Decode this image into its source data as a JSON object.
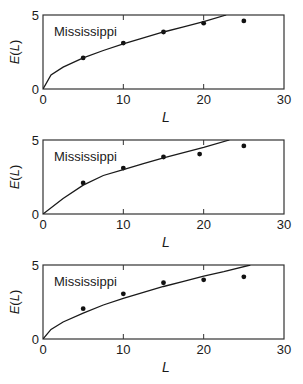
{
  "chart_data": [
    {
      "type": "scatter",
      "title": "",
      "annotation": "Mississippi",
      "xlabel": "L",
      "ylabel": "E(L)",
      "xlim": [
        0,
        30
      ],
      "ylim": [
        0,
        5
      ],
      "xticks": [
        0,
        10,
        20,
        30
      ],
      "yticks": [
        0,
        5
      ],
      "grid": false,
      "legend": "none",
      "series": [
        {
          "name": "observed",
          "kind": "points",
          "x": [
            5,
            10,
            15,
            20,
            25
          ],
          "y": [
            2.1,
            3.1,
            3.85,
            4.45,
            4.6
          ]
        },
        {
          "name": "model",
          "kind": "line",
          "x": [
            0,
            1,
            2.5,
            5,
            7.5,
            10,
            12.5,
            15,
            17.5,
            20,
            22.8
          ],
          "y": [
            0,
            0.95,
            1.48,
            2.1,
            2.6,
            3.05,
            3.45,
            3.85,
            4.2,
            4.55,
            5.0
          ]
        }
      ],
      "frame": {
        "top": 15,
        "bottom": 89
      }
    },
    {
      "type": "scatter",
      "title": "",
      "annotation": "Mississippi",
      "xlabel": "L",
      "ylabel": "E(L)",
      "xlim": [
        0,
        30
      ],
      "ylim": [
        0,
        5
      ],
      "xticks": [
        0,
        10,
        20,
        30
      ],
      "yticks": [
        0,
        5
      ],
      "grid": false,
      "legend": "none",
      "series": [
        {
          "name": "observed",
          "kind": "points",
          "x": [
            5,
            10,
            15,
            19.5,
            25
          ],
          "y": [
            2.1,
            3.1,
            3.85,
            4.05,
            4.6
          ]
        },
        {
          "name": "model",
          "kind": "line",
          "x": [
            0,
            2.5,
            5,
            7.5,
            10,
            12.5,
            15,
            17.5,
            20,
            23.2
          ],
          "y": [
            0,
            1.05,
            1.95,
            2.6,
            3.0,
            3.4,
            3.8,
            4.15,
            4.5,
            5.0
          ]
        }
      ],
      "frame": {
        "top": 140,
        "bottom": 214
      }
    },
    {
      "type": "scatter",
      "title": "",
      "annotation": "Mississippi",
      "xlabel": "L",
      "ylabel": "E(L)",
      "xlim": [
        0,
        30
      ],
      "ylim": [
        0,
        5
      ],
      "xticks": [
        0,
        10,
        20,
        30
      ],
      "yticks": [
        0,
        5
      ],
      "grid": false,
      "legend": "none",
      "series": [
        {
          "name": "observed",
          "kind": "points",
          "x": [
            5,
            10,
            15,
            20,
            25
          ],
          "y": [
            2.05,
            3.05,
            3.8,
            4.0,
            4.2
          ]
        },
        {
          "name": "model",
          "kind": "line",
          "x": [
            0,
            1,
            2.5,
            5,
            7.5,
            10,
            12.5,
            15,
            17.5,
            20,
            22.5,
            25.8
          ],
          "y": [
            0,
            0.65,
            1.15,
            1.75,
            2.3,
            2.75,
            3.15,
            3.55,
            3.9,
            4.25,
            4.55,
            5.0
          ]
        }
      ],
      "frame": {
        "top": 265,
        "bottom": 339
      }
    }
  ]
}
